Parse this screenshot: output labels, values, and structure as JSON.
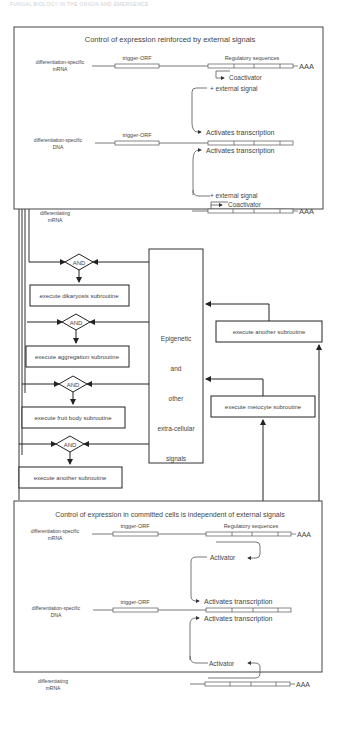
{
  "page_header": "FUNGAL BIOLOGY IN THE ORIGIN AND EMERGENCE",
  "top_panel": {
    "title": "Control of expression reinforced by external signals",
    "rows": [
      {
        "label_line1": "differentiation-specific",
        "label_line2": "mRNA",
        "orf": "trigger-ORF",
        "reg": "Regulatory sequences",
        "tail": "AAA"
      },
      {
        "label_line1": "differentiation-specific",
        "label_line2": "DNA",
        "orf": "trigger-ORF"
      },
      {
        "label_line1": "differentiating",
        "label_line2": "mRNA",
        "tail": "AAA"
      }
    ],
    "coactivator": "Coactivator",
    "external_signal": "+ external signal",
    "activates": "Activates transcription"
  },
  "flow": {
    "and_label": "AND",
    "subroutines_left": [
      "execute dikaryosis subroutine",
      "execute aggregation subroutine",
      "execute fruit body subroutine",
      "execute another subroutine"
    ],
    "center_box": [
      "Epigenetic",
      "and",
      "other",
      "extra-cellular",
      "signals"
    ],
    "subroutines_right": [
      "execute another subroutine",
      "execute meiocyte subroutine"
    ]
  },
  "bottom_panel": {
    "title": "Control of expression in committed cells is independent of external signals",
    "rows": [
      {
        "label_line1": "differentiation-specific",
        "label_line2": "mRNA",
        "orf": "trigger-ORF",
        "reg": "Regulatory sequences",
        "tail": "AAA"
      },
      {
        "label_line1": "differentiation-specific",
        "label_line2": "DNA",
        "orf": "trigger-ORF"
      },
      {
        "label_line1": "differentiating",
        "label_line2": "mRNA",
        "tail": "AAA"
      }
    ],
    "activator": "Activator",
    "activates": "Activates transcription"
  }
}
